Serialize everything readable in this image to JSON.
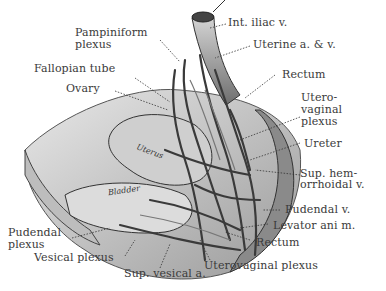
{
  "figure": {
    "labels": {
      "int_iliac_v": "Int. iliac v.",
      "pampiniform_1": "Pampiniform",
      "pampiniform_2": "plexus",
      "uterine_av": "Uterine a. & v.",
      "fallopian_tube": "Fallopian tube",
      "rectum_top": "Rectum",
      "ovary": "Ovary",
      "uterovaginal_1": "Utero-",
      "uterovaginal_2": "vaginal",
      "uterovaginal_3": "plexus",
      "ureter": "Ureter",
      "sup_hem_1": "Sup. hem-",
      "sup_hem_2": "orrhoidal v.",
      "pudendal_v": "Pudendal v.",
      "levator_ani": "Levator ani m.",
      "pudendal_plexus_1": "Pudendal",
      "pudendal_plexus_2": "plexus",
      "rectum_bottom": "Rectum",
      "vesical_plexus": "Vesical plexus",
      "uterovaginal_plexus_bottom": "Uterovaginal plexus",
      "sup_vesical_a": "Sup. vesical a.",
      "uterus": "Uterus",
      "bladder": "Bladder"
    }
  }
}
